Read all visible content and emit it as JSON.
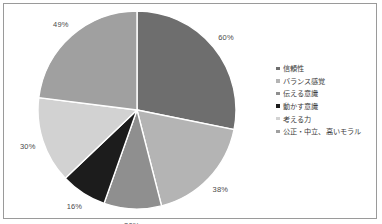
{
  "chart_data": {
    "type": "pie",
    "title": "",
    "subtitle": "",
    "xlabel": "",
    "ylabel": "",
    "grid": false,
    "legend_position": "right",
    "note": "Multi-select survey responses; percentages sum to 213% and slice angles are proportional to the values.",
    "total": 213,
    "categories": [
      "信頼性",
      "バランス感覚",
      "伝える意識",
      "動かす意識",
      "考える力",
      "公正・中立、高いモラル"
    ],
    "values": [
      60,
      38,
      20,
      16,
      30,
      49
    ],
    "labels": [
      "60%",
      "38%",
      "20%",
      "16%",
      "30%",
      "49%"
    ],
    "colors": [
      "#6e6e6e",
      "#b4b4b4",
      "#8f8f8f",
      "#1c1c1c",
      "#d2d2d2",
      "#a0a0a0"
    ],
    "slices": [
      {
        "name": "信頼性",
        "value": 60,
        "label": "60%",
        "color": "#6e6e6e"
      },
      {
        "name": "バランス感覚",
        "value": 38,
        "label": "38%",
        "color": "#b4b4b4"
      },
      {
        "name": "伝える意識",
        "value": 20,
        "label": "20%",
        "color": "#8f8f8f"
      },
      {
        "name": "動かす意識",
        "value": 16,
        "label": "16%",
        "color": "#1c1c1c"
      },
      {
        "name": "考える力",
        "value": 30,
        "label": "30%",
        "color": "#d2d2d2"
      },
      {
        "name": "公正・中立、高いモラル",
        "value": 49,
        "label": "49%",
        "color": "#a0a0a0"
      }
    ]
  },
  "legend": {
    "items": [
      {
        "label": "信頼性",
        "color": "#6e6e6e"
      },
      {
        "label": "バランス感覚",
        "color": "#b4b4b4"
      },
      {
        "label": "伝える意識",
        "color": "#8f8f8f"
      },
      {
        "label": "動かす意識",
        "color": "#1c1c1c"
      },
      {
        "label": "考える力",
        "color": "#d2d2d2"
      },
      {
        "label": "公正・中立、高いモラル",
        "color": "#a0a0a0"
      }
    ]
  },
  "style": {
    "background": "#ffffff",
    "frame_border": "#9a9a9a",
    "slice_separator": "#ffffff",
    "label_color": "#4a4a4a"
  }
}
